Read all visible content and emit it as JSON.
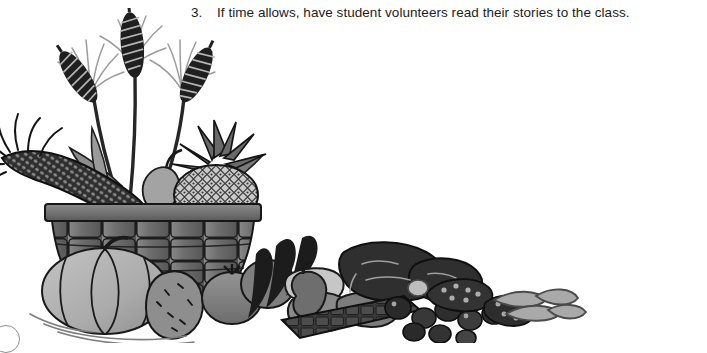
{
  "page": {
    "background_color": "#ffffff",
    "width": 707,
    "height": 343
  },
  "instruction": {
    "number": "3.",
    "text": "If time allows, have student volunteers read their stories to the class.",
    "text_color": "#1c1c1c"
  },
  "illustration": {
    "name": "harvest-basket-clipart",
    "description": "Grayscale clipart of a woven harvest basket overflowing with wheat stalks, corn, pineapple, pumpkin, squash, potatoes, sweet potatoes, tomatoes, berries and nuts",
    "style": "grayscale line art",
    "palette": {
      "outline": "#141414",
      "darkest": "#2b2b2b",
      "dark": "#3f3f3f",
      "mid_dark": "#5c5c5c",
      "mid": "#747474",
      "mid_light": "#8e8e8e",
      "light": "#a8a8a8",
      "lighter": "#bdbdbd",
      "lightest": "#d4d4d4",
      "white": "#ffffff"
    },
    "elements": [
      "wheat-stalks",
      "corn-cob",
      "pineapple",
      "pear",
      "woven-basket",
      "pumpkin",
      "potato",
      "tomatoes",
      "dark-leaves",
      "squash",
      "zucchini",
      "sweet-potatoes",
      "berries",
      "nuts",
      "pea-pods",
      "grid-tray"
    ]
  },
  "page_marker": {
    "name": "page-number-bubble",
    "visible": true
  }
}
